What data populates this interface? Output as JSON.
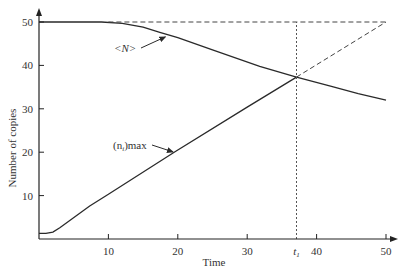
{
  "chart_data": {
    "type": "line",
    "title": "",
    "xlabel": "Time",
    "ylabel": "Number of copies",
    "xlim": [
      0,
      50
    ],
    "ylim": [
      0,
      50
    ],
    "grid": false,
    "x_ticks": [
      10,
      20,
      30,
      40,
      50
    ],
    "y_ticks": [
      10,
      20,
      30,
      40,
      50
    ],
    "special_x_tick": {
      "label": "t",
      "subscript": "1",
      "value": 37.1
    },
    "series": [
      {
        "name": "<N>",
        "style": "solid",
        "x": [
          0,
          5,
          9,
          12,
          15,
          17.4,
          20,
          25,
          31.8,
          37.1,
          42,
          46,
          50
        ],
        "y": [
          50,
          50,
          50,
          49.7,
          48.8,
          47.6,
          46.4,
          43.6,
          39.8,
          37.3,
          35.2,
          33.5,
          32
        ]
      },
      {
        "name": "(n_i)max",
        "style": "solid",
        "x": [
          0,
          1,
          2,
          3,
          7.3,
          10,
          19.6,
          30,
          37.1
        ],
        "y": [
          1.3,
          1.3,
          1.6,
          2.6,
          7.6,
          10.3,
          20.1,
          30.4,
          37.3
        ]
      },
      {
        "name": "(n_i)max extrapolation",
        "style": "dashed",
        "x": [
          37.1,
          50
        ],
        "y": [
          37.3,
          50
        ]
      },
      {
        "name": "initial N level",
        "style": "dashed",
        "x": [
          10,
          50
        ],
        "y": [
          50,
          50
        ]
      },
      {
        "name": "t1 marker",
        "style": "dotted",
        "x": [
          37.1,
          37.1
        ],
        "y": [
          0,
          50
        ]
      }
    ],
    "annotations": [
      {
        "text": "<N>",
        "points_to": "<N>",
        "target": [
          18.5,
          46.8
        ]
      },
      {
        "text_main": "(n",
        "text_sub": "i",
        "text_tail": ")max",
        "points_to": "(n_i)max",
        "target": [
          19.6,
          20.3
        ]
      }
    ]
  }
}
